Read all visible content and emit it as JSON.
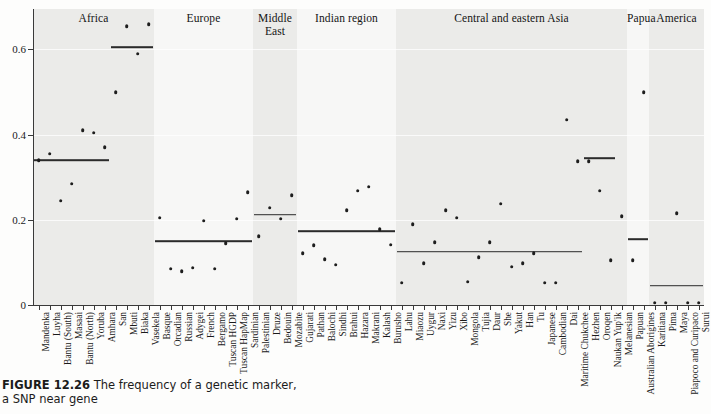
{
  "figure": {
    "caption_label": "FIGURE 12.26",
    "caption_text": "The frequency of a genetic marker, a SNP near gene"
  },
  "axes": {
    "ylabel": "Allele frequency",
    "yticks": [
      0,
      0.2,
      0.4,
      0.6
    ],
    "ytick_labels": [
      "0",
      "0.2",
      "0.4",
      "0.6"
    ],
    "ylim": [
      0,
      0.695
    ],
    "grid": true
  },
  "chart_data": {
    "type": "scatter",
    "title": "",
    "xlabel": "",
    "ylabel": "Allele frequency",
    "ylim": [
      0,
      0.695
    ],
    "grid": true,
    "legend": "none",
    "marker": "filled-circle",
    "group_mean_line": true,
    "groups": [
      {
        "name": "Africa",
        "shaded": true,
        "mean_segments": [
          {
            "value": 0.34,
            "from_index": 0,
            "to_index": 6
          },
          {
            "value": 0.605,
            "from_index": 7,
            "to_index": 10
          }
        ],
        "points": [
          {
            "label": "Mandenka",
            "value": 0.34
          },
          {
            "label": "Luyha",
            "value": 0.355
          },
          {
            "label": "Bantu (South)",
            "value": 0.245
          },
          {
            "label": "Masaai",
            "value": 0.285
          },
          {
            "label": "Bantu (North)",
            "value": 0.41
          },
          {
            "label": "Yoruba",
            "value": 0.405
          },
          {
            "label": "Amhara",
            "value": 0.37
          },
          {
            "label": "San",
            "value": 0.5
          },
          {
            "label": "Mbuti",
            "value": 0.655
          },
          {
            "label": "Biaka",
            "value": 0.59
          },
          {
            "label": "Vasekela",
            "value": 0.66
          }
        ]
      },
      {
        "name": "Europe",
        "shaded": false,
        "mean_segments": [
          {
            "value": 0.15,
            "from_index": 0,
            "to_index": 8
          }
        ],
        "points": [
          {
            "label": "Basque",
            "value": 0.205
          },
          {
            "label": "Orcadian",
            "value": 0.085
          },
          {
            "label": "Russian",
            "value": 0.08
          },
          {
            "label": "Adygei",
            "value": 0.088
          },
          {
            "label": "French",
            "value": 0.198
          },
          {
            "label": "Bergamo",
            "value": 0.085
          },
          {
            "label": "Tuscan HGDP",
            "value": 0.145
          },
          {
            "label": "Tuscan HapMap",
            "value": 0.203
          },
          {
            "label": "Sardinian",
            "value": 0.265
          }
        ]
      },
      {
        "name": "Middle East",
        "shaded": true,
        "mean_segments": [
          {
            "value": 0.212,
            "from_index": 0,
            "to_index": 3
          }
        ],
        "points": [
          {
            "label": "Palestinian",
            "value": 0.162
          },
          {
            "label": "Druze",
            "value": 0.228
          },
          {
            "label": "Bedouin",
            "value": 0.203
          },
          {
            "label": "Mozabite",
            "value": 0.258
          }
        ]
      },
      {
        "name": "Indian region",
        "shaded": false,
        "mean_segments": [
          {
            "value": 0.173,
            "from_index": 0,
            "to_index": 8
          }
        ],
        "points": [
          {
            "label": "Gujarati",
            "value": 0.122
          },
          {
            "label": "Pathan",
            "value": 0.14
          },
          {
            "label": "Balochi",
            "value": 0.108
          },
          {
            "label": "Sindhi",
            "value": 0.095
          },
          {
            "label": "Brahui",
            "value": 0.222
          },
          {
            "label": "Hazara",
            "value": 0.268
          },
          {
            "label": "Makrani",
            "value": 0.278
          },
          {
            "label": "Kalash",
            "value": 0.178
          },
          {
            "label": "Burusho",
            "value": 0.142
          }
        ]
      },
      {
        "name": "Central and eastern Asia",
        "shaded": true,
        "mean_segments": [
          {
            "value": 0.125,
            "from_index": 0,
            "to_index": 16
          },
          {
            "value": 0.345,
            "from_index": 17,
            "to_index": 19
          }
        ],
        "points": [
          {
            "label": "Lahu",
            "value": 0.052
          },
          {
            "label": "Miaozu",
            "value": 0.19
          },
          {
            "label": "Uygur",
            "value": 0.098
          },
          {
            "label": "Naxi",
            "value": 0.148
          },
          {
            "label": "Yizu",
            "value": 0.222
          },
          {
            "label": "Xibo",
            "value": 0.205
          },
          {
            "label": "Mongola",
            "value": 0.055
          },
          {
            "label": "Tujia",
            "value": 0.112
          },
          {
            "label": "Daur",
            "value": 0.148
          },
          {
            "label": "She",
            "value": 0.238
          },
          {
            "label": "Yakut",
            "value": 0.09
          },
          {
            "label": "Han",
            "value": 0.098
          },
          {
            "label": "Tu",
            "value": 0.122
          },
          {
            "label": "Japanese",
            "value": 0.052
          },
          {
            "label": "Cambodian",
            "value": 0.052
          },
          {
            "label": "Dai",
            "value": 0.435
          },
          {
            "label": "Maritime Chukchee",
            "value": 0.338
          },
          {
            "label": "Hezhen",
            "value": 0.338
          },
          {
            "label": "Oroqen",
            "value": 0.268
          },
          {
            "label": "Naukan Yup'ik",
            "value": 0.105
          },
          {
            "label": "Melanesian",
            "value": 0.208
          }
        ]
      },
      {
        "name": "Papua",
        "shaded": false,
        "mean_segments": [
          {
            "value": 0.155,
            "from_index": 0,
            "to_index": 1
          }
        ],
        "points": [
          {
            "label": "Papuan",
            "value": 0.105
          },
          {
            "label": "Australian Aborigines",
            "value": 0.5
          }
        ]
      },
      {
        "name": "America",
        "shaded": true,
        "mean_segments": [
          {
            "value": 0.045,
            "from_index": 0,
            "to_index": 4
          }
        ],
        "points": [
          {
            "label": "Karitiana",
            "value": 0.005
          },
          {
            "label": "Pima",
            "value": 0.005
          },
          {
            "label": "Maya",
            "value": 0.215
          },
          {
            "label": "Piapoco and Curipaco",
            "value": 0.005
          },
          {
            "label": "Surui",
            "value": 0.005
          }
        ]
      }
    ]
  }
}
